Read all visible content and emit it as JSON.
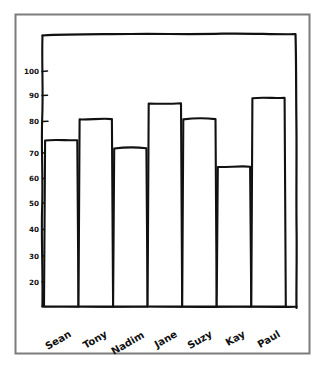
{
  "figure": {
    "background_color": "#ffffff",
    "frame_color": "#7c7c7c",
    "ink_color": "#111111",
    "style": "hand-drawn sketch"
  },
  "chart_data": {
    "type": "bar",
    "title": "",
    "subtitle": "",
    "xlabel": "",
    "ylabel": "",
    "categories": [
      "Sean",
      "Tony",
      "Nadim",
      "Jane",
      "Suzy",
      "Kay",
      "Paul"
    ],
    "values": [
      74,
      82,
      71,
      88,
      82,
      64,
      90
    ],
    "ylim": [
      11,
      107
    ],
    "yticks": [
      20,
      30,
      40,
      50,
      60,
      70,
      80,
      90,
      100
    ],
    "ytick_labels": [
      "20",
      "30",
      "40",
      "50",
      "60",
      "70",
      "80",
      "90",
      "100"
    ],
    "grid": false,
    "legend": null,
    "bar_fill": "#ffffff",
    "bar_edge": "#111111",
    "xtick_label_rotation": 30
  },
  "axes": {
    "y_axis_name": "y-axis",
    "x_axis_name": "x-axis",
    "tick_label_color": "#111111"
  }
}
